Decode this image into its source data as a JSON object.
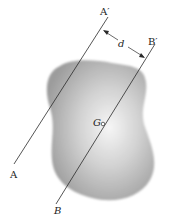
{
  "figure": {
    "labels": {
      "A": "A",
      "A_prime": "A′",
      "B": "B",
      "B_prime": "B′",
      "d": "d",
      "G": "G"
    },
    "colors": {
      "line": "#2a2a2a",
      "body_edge": "#9a9a9a",
      "body_center": "#f4f4f4",
      "background": "#ffffff"
    }
  }
}
